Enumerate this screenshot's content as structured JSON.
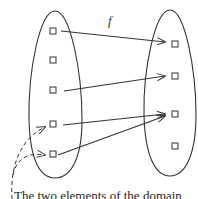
{
  "diagram": {
    "function_label": "f",
    "caption": "The two elements of the domain",
    "colors": {
      "stroke": "#333333",
      "background": "#ffffff"
    },
    "domain_set": {
      "shape": "ellipse",
      "elements": [
        {
          "id": "d1",
          "x": 53,
          "y": 31
        },
        {
          "id": "d2",
          "x": 53,
          "y": 60
        },
        {
          "id": "d3",
          "x": 53,
          "y": 90
        },
        {
          "id": "d4",
          "x": 53,
          "y": 124
        },
        {
          "id": "d5",
          "x": 53,
          "y": 154
        }
      ]
    },
    "codomain_set": {
      "shape": "ellipse",
      "elements": [
        {
          "id": "c1",
          "x": 175,
          "y": 44
        },
        {
          "id": "c2",
          "x": 175,
          "y": 76
        },
        {
          "id": "c3",
          "x": 175,
          "y": 114
        },
        {
          "id": "c4",
          "x": 175,
          "y": 146
        }
      ]
    },
    "mappings": [
      {
        "from": "d1",
        "to": "c1"
      },
      {
        "from": "d3",
        "to": "c2"
      },
      {
        "from": "d4",
        "to": "c3"
      },
      {
        "from": "d5",
        "to": "c3"
      }
    ],
    "annotation_pointers": [
      {
        "target": "d4",
        "style": "dashed"
      },
      {
        "target": "d5",
        "style": "dashed"
      }
    ]
  }
}
